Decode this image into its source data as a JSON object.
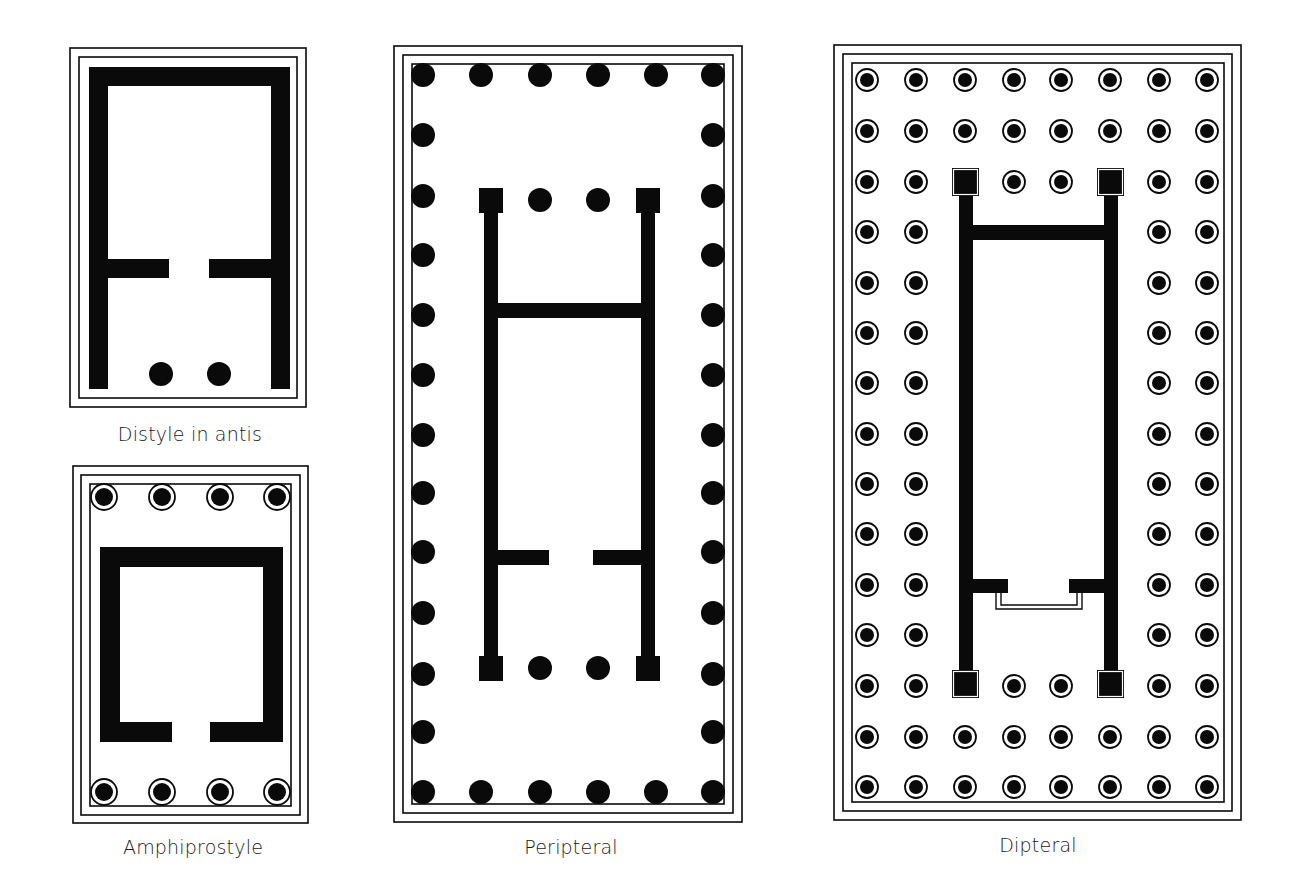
{
  "colors": {
    "ink": "#0a0a0a",
    "paper": "#ffffff",
    "label": "#1a1a1a"
  },
  "plans": [
    {
      "id": "distyle-in-antis",
      "label": "Distyle in antis",
      "label_pos": {
        "x": 190,
        "y": 423
      },
      "borders": [
        [
          70,
          48,
          306,
          407
        ],
        [
          79,
          57,
          297,
          398
        ]
      ],
      "walls": [
        [
          89,
          67,
          290,
          86
        ],
        [
          89,
          67,
          108,
          389
        ],
        [
          271,
          67,
          290,
          389
        ],
        [
          108,
          259,
          169,
          278
        ],
        [
          209,
          259,
          271,
          278
        ]
      ],
      "columns": {
        "style": "solid",
        "r": 12,
        "points": [
          [
            161,
            374
          ],
          [
            219,
            374
          ]
        ]
      },
      "antae": []
    },
    {
      "id": "amphiprostyle",
      "label": "Amphiprostyle",
      "label_pos": {
        "x": 193,
        "y": 836
      },
      "borders": [
        [
          73,
          466,
          308,
          823
        ],
        [
          81,
          475,
          300,
          815
        ],
        [
          90,
          484,
          291,
          806
        ]
      ],
      "walls": [
        [
          100,
          547,
          283,
          567
        ],
        [
          100,
          547,
          120,
          742
        ],
        [
          263,
          547,
          283,
          742
        ],
        [
          100,
          722,
          172,
          742
        ],
        [
          210,
          722,
          283,
          742
        ]
      ],
      "columns": {
        "style": "ringed",
        "r": 13,
        "points": [
          [
            104,
            497
          ],
          [
            162,
            497
          ],
          [
            220,
            497
          ],
          [
            277,
            497
          ],
          [
            104,
            792
          ],
          [
            162,
            792
          ],
          [
            220,
            792
          ],
          [
            277,
            792
          ]
        ]
      },
      "antae": []
    },
    {
      "id": "peripteral",
      "label": "Peripteral",
      "label_pos": {
        "x": 571,
        "y": 836
      },
      "borders": [
        [
          394,
          46,
          742,
          822
        ],
        [
          403,
          55,
          733,
          813
        ],
        [
          412,
          64,
          724,
          804
        ]
      ],
      "walls": [
        [
          484,
          200,
          498,
          680
        ],
        [
          641,
          200,
          655,
          680
        ],
        [
          498,
          303,
          641,
          318
        ],
        [
          498,
          550,
          549,
          565
        ],
        [
          593,
          550,
          641,
          565
        ]
      ],
      "columns": {
        "style": "solid",
        "r": 12,
        "front_xs": [
          423,
          481,
          540,
          598,
          656,
          713
        ],
        "side_ys": [
          75,
          135,
          196,
          255,
          315,
          375,
          435,
          493,
          552,
          613,
          674,
          732,
          792
        ],
        "inner_points": [
          [
            540,
            200
          ],
          [
            598,
            200
          ],
          [
            540,
            668
          ],
          [
            598,
            668
          ]
        ]
      },
      "antae": [
        [
          479,
          188,
          503,
          213
        ],
        [
          636,
          188,
          660,
          213
        ],
        [
          479,
          656,
          503,
          681
        ],
        [
          636,
          656,
          660,
          681
        ]
      ]
    },
    {
      "id": "dipteral",
      "label": "Dipteral",
      "label_pos": {
        "x": 1038,
        "y": 834
      },
      "borders": [
        [
          834,
          45,
          1241,
          820
        ],
        [
          843,
          54,
          1232,
          811
        ],
        [
          852,
          63,
          1224,
          802
        ]
      ],
      "walls": [
        [
          959,
          182,
          973,
          684
        ],
        [
          1104,
          182,
          1118,
          684
        ],
        [
          973,
          225,
          1104,
          240
        ],
        [
          973,
          579,
          1008,
          593
        ],
        [
          1069,
          579,
          1104,
          593
        ]
      ],
      "threshold": [
        [
          996,
          593,
          1082,
          609
        ],
        [
          1001,
          593,
          1077,
          605
        ]
      ],
      "columns": {
        "style": "ringed",
        "r": 11,
        "xs": [
          867,
          916,
          965,
          1014,
          1061,
          1110,
          1159,
          1207
        ],
        "ys": [
          80,
          131,
          182,
          232,
          283,
          333,
          383,
          434,
          484,
          534,
          585,
          635,
          686,
          737,
          787
        ],
        "outer_rows_full": [
          0,
          1,
          13,
          14
        ],
        "side_xs": [
          867,
          916,
          1159,
          1207
        ],
        "inner_points": [
          [
            1014,
            182
          ],
          [
            1061,
            182
          ],
          [
            1014,
            686
          ],
          [
            1061,
            686
          ]
        ]
      },
      "antae": [
        [
          952,
          168,
          979,
          196
        ],
        [
          1097,
          168,
          1124,
          196
        ],
        [
          952,
          670,
          979,
          698
        ],
        [
          1097,
          670,
          1124,
          698
        ]
      ]
    }
  ]
}
